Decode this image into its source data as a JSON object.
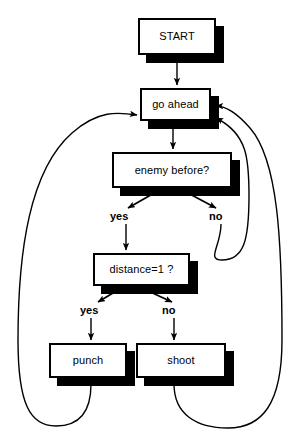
{
  "diagram": {
    "colors": {
      "stroke": "#000000",
      "fill": "#ffffff",
      "shadow": "#000000"
    },
    "nodes": [
      {
        "id": "start",
        "label": "START",
        "type": "process",
        "x": 138,
        "y": 18,
        "w": 78,
        "h": 37
      },
      {
        "id": "go_ahead",
        "label": "go ahead",
        "type": "process",
        "x": 140,
        "y": 88,
        "w": 71,
        "h": 33
      },
      {
        "id": "enemy",
        "label": "enemy before?",
        "type": "decision",
        "x": 112,
        "y": 152,
        "w": 120,
        "h": 36
      },
      {
        "id": "distance",
        "label": "distance=1 ?",
        "type": "decision",
        "x": 93,
        "y": 253,
        "w": 97,
        "h": 33
      },
      {
        "id": "punch",
        "label": "punch",
        "type": "process",
        "x": 49,
        "y": 343,
        "w": 78,
        "h": 35
      },
      {
        "id": "shoot",
        "label": "shoot",
        "type": "process",
        "x": 136,
        "y": 343,
        "w": 90,
        "h": 35
      }
    ],
    "edge_labels": [
      {
        "id": "enemy-yes",
        "text": "yes",
        "x": 110,
        "y": 211
      },
      {
        "id": "enemy-no",
        "text": "no",
        "x": 209,
        "y": 211
      },
      {
        "id": "distance-yes",
        "text": "yes",
        "x": 80,
        "y": 305
      },
      {
        "id": "distance-no",
        "text": "no",
        "x": 162,
        "y": 305
      }
    ],
    "edges": [
      {
        "id": "start-to-go-ahead",
        "from": "start",
        "to": "go_ahead",
        "kind": "straight"
      },
      {
        "id": "go-ahead-to-enemy",
        "from": "go_ahead",
        "to": "enemy",
        "kind": "straight"
      },
      {
        "id": "enemy-yes-branch",
        "from": "enemy",
        "to": "distance",
        "kind": "branch",
        "label": "yes"
      },
      {
        "id": "enemy-no-branch",
        "from": "enemy",
        "to": "go_ahead",
        "kind": "loop",
        "label": "no"
      },
      {
        "id": "distance-yes-branch",
        "from": "distance",
        "to": "punch",
        "kind": "branch",
        "label": "yes"
      },
      {
        "id": "distance-no-branch",
        "from": "distance",
        "to": "shoot",
        "kind": "branch",
        "label": "no"
      },
      {
        "id": "punch-to-go-ahead",
        "from": "punch",
        "to": "go_ahead",
        "kind": "loop"
      },
      {
        "id": "shoot-to-go-ahead",
        "from": "shoot",
        "to": "go_ahead",
        "kind": "loop"
      }
    ]
  }
}
